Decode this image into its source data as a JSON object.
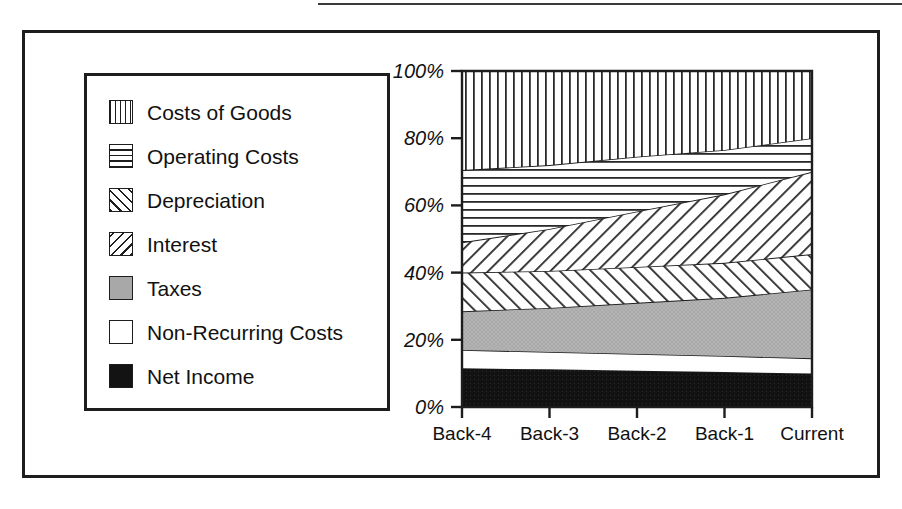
{
  "figure": {
    "has_top_rule": true,
    "frame_color": "#1d1d1d",
    "background": "#ffffff"
  },
  "legend": {
    "items": [
      {
        "label": "Costs of Goods",
        "pattern": "vertical-lines",
        "swatch_name": "swatch-costs-of-goods"
      },
      {
        "label": "Operating Costs",
        "pattern": "horizontal-lines",
        "swatch_name": "swatch-operating-costs"
      },
      {
        "label": "Depreciation",
        "pattern": "diagonal-forward",
        "swatch_name": "swatch-depreciation"
      },
      {
        "label": "Interest",
        "pattern": "diagonal-back",
        "swatch_name": "swatch-interest"
      },
      {
        "label": "Taxes",
        "pattern": "solid-gray",
        "swatch_name": "swatch-taxes"
      },
      {
        "label": "Non-Recurring Costs",
        "pattern": "solid-white",
        "swatch_name": "swatch-non-recurring-costs"
      },
      {
        "label": "Net Income",
        "pattern": "solid-black",
        "swatch_name": "swatch-net-income"
      }
    ]
  },
  "chart_data": {
    "type": "area",
    "stacked": true,
    "normalized": true,
    "title": "",
    "xlabel": "",
    "ylabel": "",
    "grid": false,
    "legend_position": "left",
    "categories": [
      "Back-4",
      "Back-3",
      "Back-2",
      "Back-1",
      "Current"
    ],
    "x": [
      "Back-4",
      "Back-3",
      "Back-2",
      "Back-1",
      "Current"
    ],
    "ylim": [
      0,
      100
    ],
    "ytick_labels": [
      "0%",
      "20%",
      "40%",
      "60%",
      "80%",
      "100%"
    ],
    "ytick_values": [
      0,
      20,
      40,
      60,
      80,
      100
    ],
    "series": [
      {
        "name": "Net Income",
        "pattern": "solid-black",
        "values": [
          11.5,
          11.2,
          10.8,
          10.4,
          10.0
        ]
      },
      {
        "name": "Non-Recurring Costs",
        "pattern": "solid-white",
        "values": [
          5.5,
          5.2,
          5.0,
          4.8,
          4.5
        ]
      },
      {
        "name": "Taxes",
        "pattern": "solid-gray",
        "values": [
          11.5,
          13.1,
          15.2,
          17.3,
          20.5
        ]
      },
      {
        "name": "Interest",
        "pattern": "diagonal-back",
        "values": [
          11.5,
          11.0,
          10.7,
          10.4,
          10.5
        ]
      },
      {
        "name": "Depreciation",
        "pattern": "diagonal-forward",
        "values": [
          9.0,
          12.5,
          16.5,
          20.4,
          24.5
        ]
      },
      {
        "name": "Operating Costs",
        "pattern": "horizontal-lines",
        "values": [
          21.5,
          19.0,
          16.3,
          13.2,
          10.0
        ]
      },
      {
        "name": "Costs of Goods",
        "pattern": "vertical-lines",
        "values": [
          29.5,
          28.0,
          25.5,
          23.5,
          20.0
        ]
      }
    ],
    "cumulative_tops": {
      "net_income": [
        11.5,
        11.2,
        10.8,
        10.4,
        10.0
      ],
      "non_recurring_costs": [
        17.0,
        16.4,
        15.8,
        15.2,
        14.5
      ],
      "taxes": [
        28.5,
        29.5,
        31.0,
        32.5,
        35.0
      ],
      "interest": [
        40.0,
        40.5,
        41.7,
        42.9,
        45.5
      ],
      "depreciation": [
        49.0,
        53.0,
        58.2,
        63.3,
        70.0
      ],
      "operating_costs": [
        70.5,
        72.0,
        74.5,
        76.5,
        80.0
      ],
      "costs_of_goods": [
        100,
        100,
        100,
        100,
        100
      ]
    }
  }
}
